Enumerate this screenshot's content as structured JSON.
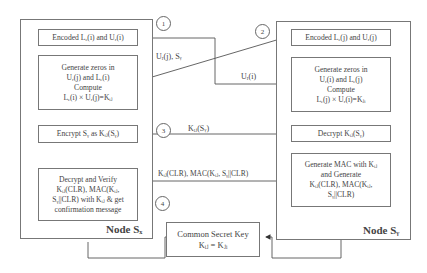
{
  "diagram": {
    "nodes": {
      "sx": {
        "label": "Node Sₓ"
      },
      "sy": {
        "label": "Node Sᵧ"
      }
    },
    "left_boxes": [
      {
        "id": "encoded-sx",
        "lines": [
          "Encoded Lₑ(i) and Uᵣ(i)"
        ]
      },
      {
        "id": "generate-zeros-sx",
        "lines": [
          "Generate zeros in",
          "Uᵣ(j) and Lₑ(i)",
          "Compute",
          "Lₑ(i) × Uᵣ(j)=Kᵢⱼ"
        ]
      },
      {
        "id": "encrypt-sy",
        "lines": [
          "Encrypt Sᵧ as Kᵢⱼ(Sᵧ)"
        ]
      },
      {
        "id": "decrypt-verify",
        "lines": [
          "Decrypt and Verify",
          "Kᵢⱼ(CLR), MAC(Kᵢⱼ,",
          "Sᵧ||CLR) with Kᵢⱼ & get",
          "confirmation message"
        ]
      }
    ],
    "right_boxes": [
      {
        "id": "encoded-sy",
        "lines": [
          "Encoded Lₑ(j) and Uᵣ(j)"
        ]
      },
      {
        "id": "generate-zeros-sy",
        "lines": [
          "Generate zeros in",
          "Uᵣ(i) and Lₑ(j)",
          "Compute",
          "Lₑ(j) × Uᵣ(i)=Kⱼᵢ"
        ]
      },
      {
        "id": "decrypt-sy",
        "lines": [
          "Decrypt Kᵢⱼ(Sᵧ)"
        ]
      },
      {
        "id": "generate-mac",
        "lines": [
          "Generate MAC with Kᵢⱼ",
          "and Generate",
          "Kᵢⱼ(CLR), MAC(Kᵢⱼ,",
          "Sᵧ||CLR)"
        ]
      }
    ],
    "common_key": {
      "lines": [
        "Common Secret Key",
        "Kᵢⱼ = Kⱼᵢ"
      ]
    },
    "steps": [
      "1",
      "2",
      "3",
      "4"
    ],
    "edge_labels": {
      "uc_j_sy": "Uᵣ(j), Sᵧ",
      "uc_i": "Uᵣ(i)",
      "kij_sy": "Kᵢⱼ(Sᵧ)",
      "mac_msg": "Kᵢⱼ(CLR), MAC(Kᵢⱼ, Sᵧ||CLR)"
    }
  }
}
